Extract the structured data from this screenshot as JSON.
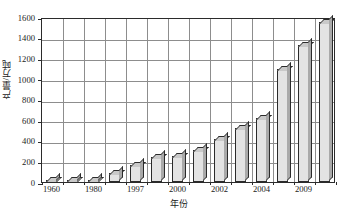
{
  "chart_data": {
    "type": "bar",
    "title": "",
    "subtitle": "",
    "xlabel": "年份",
    "ylabel": "产量/万吨",
    "ylim": [
      0,
      1600
    ],
    "ytick_step": 200,
    "yticks": [
      0,
      200,
      400,
      600,
      800,
      1000,
      1200,
      1400,
      1600
    ],
    "ytick_labels": [
      "0",
      "200",
      "400",
      "600",
      "800",
      "1000",
      "1200",
      "1400",
      "1600"
    ],
    "grid": true,
    "legend": "none",
    "categories": [
      "1960",
      "",
      "1980",
      "",
      "1997",
      "",
      "2000",
      "",
      "2002",
      "",
      "2004",
      "",
      "2009",
      ""
    ],
    "xtick_labels": [
      "1960",
      "1980",
      "1997",
      "2000",
      "2002",
      "2004",
      "2009"
    ],
    "xtick_label_positions": [
      0,
      2,
      4,
      6,
      8,
      10,
      12
    ],
    "values": [
      5,
      12,
      20,
      90,
      165,
      245,
      250,
      310,
      420,
      520,
      625,
      1100,
      1330,
      1550
    ],
    "bar_style": "3d-extruded",
    "bar_fill_color": "#e3e3e3",
    "bar_top_color": "#c9c9c9",
    "bar_side_color": "#a9a9a9",
    "bar_edge_color": "#2b2b2b",
    "grid_color": "#8d8d8d",
    "axis_color": "#2b2b2b",
    "background_color": "#ffffff"
  }
}
